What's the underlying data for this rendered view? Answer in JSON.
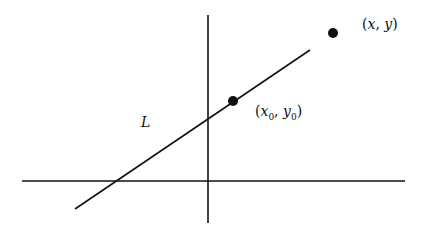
{
  "diagram": {
    "type": "coordinate-geometry",
    "line_label": "L",
    "point_general": {
      "label": "(x, y)",
      "x_var": "x",
      "y_var": "y"
    },
    "point_fixed": {
      "label": "(x0, y0)",
      "x_var": "x",
      "y_var": "y",
      "subscript": "0"
    },
    "open_paren": "(",
    "close_paren": ")",
    "comma": ", ",
    "colors": {
      "stroke": "#111111",
      "background": "#ffffff"
    }
  }
}
